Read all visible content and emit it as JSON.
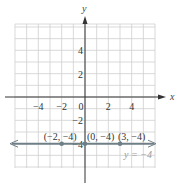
{
  "chart_data": {
    "type": "line",
    "title": "",
    "xlabel": "x",
    "ylabel": "y",
    "xlim": [
      -6,
      6
    ],
    "ylim": [
      -6,
      6.2
    ],
    "grid": true,
    "x_ticks": [
      {
        "value": -4,
        "label": "−4"
      },
      {
        "value": -2,
        "label": "−2"
      },
      {
        "value": 2,
        "label": "2"
      },
      {
        "value": 4,
        "label": "4"
      }
    ],
    "origin_label": "0",
    "y_ticks": [
      {
        "value": 4,
        "label": "4"
      },
      {
        "value": 2,
        "label": "2"
      },
      {
        "value": -2,
        "label": "−2"
      },
      {
        "value": -4,
        "label": "−4"
      }
    ],
    "series": [
      {
        "name": "y = −4",
        "equation_label": "y = −4",
        "type": "horizontal-line",
        "y": -4,
        "color": "#6f7f86",
        "arrows": "both"
      }
    ],
    "points": [
      {
        "x": -2,
        "y": -4,
        "label": "(−2, −4)"
      },
      {
        "x": 0,
        "y": -4,
        "label": "(0, −4)"
      },
      {
        "x": 3,
        "y": -4,
        "label": "(3, −4)"
      }
    ],
    "colors": {
      "grid": "#cfcfcf",
      "axis": "#333333",
      "line": "#6f7f86",
      "point": "#6f7f86"
    }
  }
}
